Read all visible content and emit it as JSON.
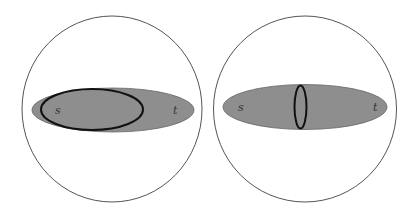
{
  "panels": [
    {
      "id": "left",
      "labels": {
        "source": "s",
        "target": "t"
      },
      "colors": {
        "region_fill": "#8e8e8e",
        "outline": "#111111",
        "circle": "#555555"
      }
    },
    {
      "id": "right",
      "labels": {
        "source": "s",
        "target": "t"
      },
      "colors": {
        "region_fill": "#8e8e8e",
        "outline": "#111111",
        "circle": "#555555"
      }
    }
  ]
}
